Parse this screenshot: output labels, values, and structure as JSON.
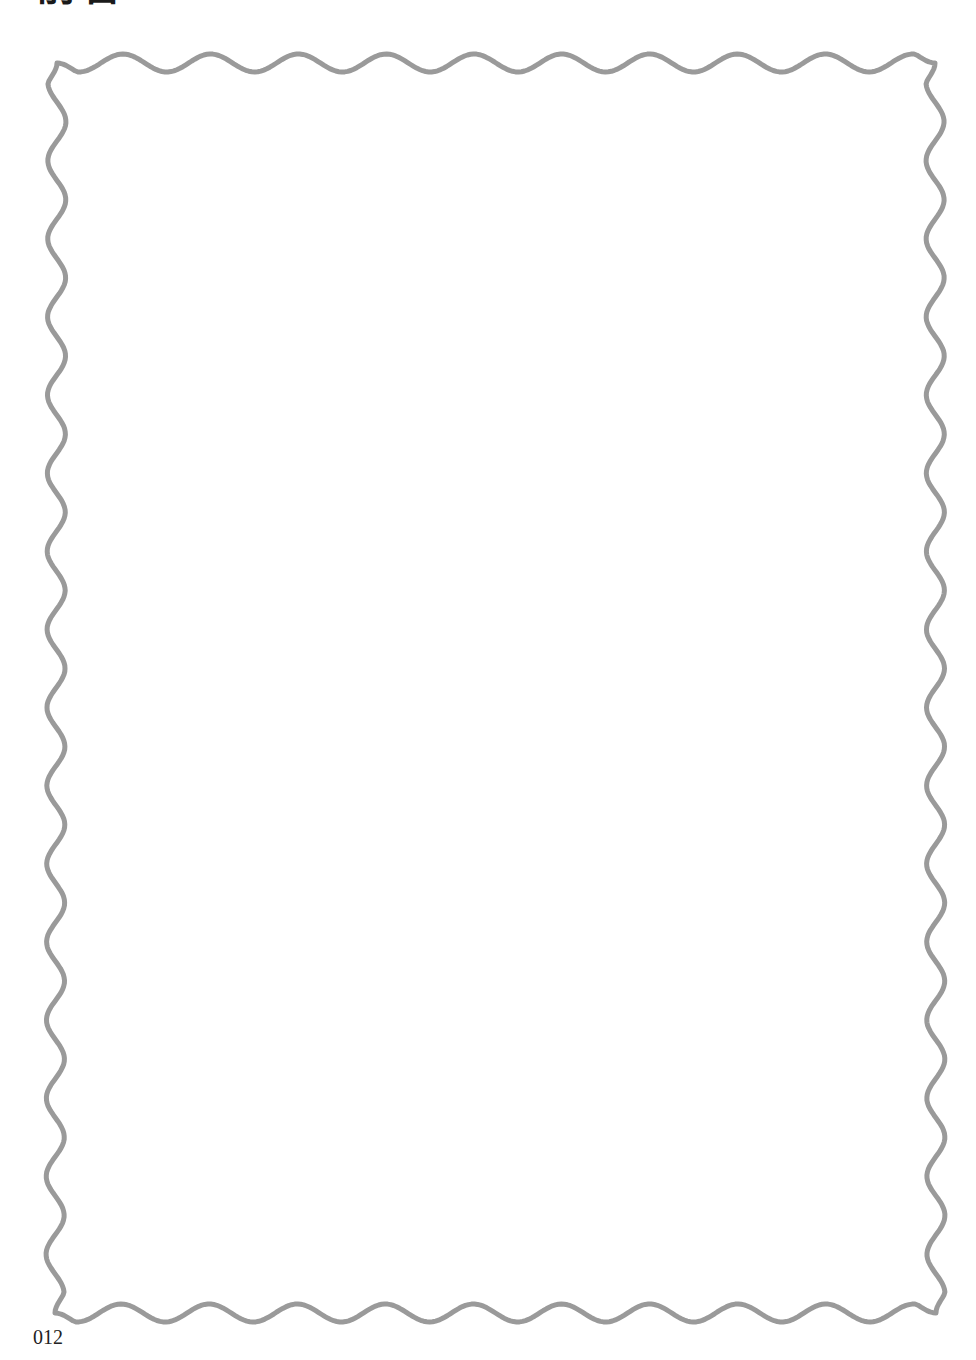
{
  "page": {
    "title_zh": "前言",
    "title_en": "PREFACE",
    "page_number": "012"
  },
  "frame": {
    "style": "wavy-border",
    "stroke_color": "#9a9a9a",
    "fill_color": "#ffffff",
    "content": ""
  }
}
